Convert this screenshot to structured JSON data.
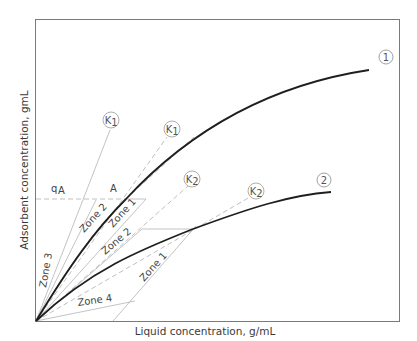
{
  "diagram": {
    "type": "adsorption isotherm zone diagram",
    "x_axis_label": "Liquid concentration, g/mL",
    "y_axis_label": "Adsorbent concentration, gmL",
    "curves": [
      {
        "id": "1",
        "label": "1",
        "style": "thick solid",
        "description": "upper isotherm curve"
      },
      {
        "id": "2",
        "label": "2",
        "style": "thick solid",
        "description": "lower isotherm curve"
      }
    ],
    "line_labels": [
      {
        "label": "K",
        "subscript": "1",
        "style": "thin solid"
      },
      {
        "label": "K",
        "subscript": "1",
        "style": "dashed"
      },
      {
        "label": "K",
        "subscript": "2",
        "style": "dashed"
      },
      {
        "label": "K",
        "subscript": "2",
        "style": "dashed"
      }
    ],
    "point_labels": {
      "q_label": "q",
      "q_subscript": "A",
      "point_A": "A"
    },
    "zones": [
      {
        "label": "Zone 3"
      },
      {
        "label": "Zone 2"
      },
      {
        "label": "Zone 1"
      },
      {
        "label": "Zone 2"
      },
      {
        "label": "Zone 1"
      },
      {
        "label": "Zone 4"
      }
    ],
    "colors": {
      "frame": "#7a7a7a",
      "curve": "#1e1e1e",
      "light_line": "#b4b4b4",
      "dashed_line": "#b8b8b8",
      "text": "#3a3a3a"
    }
  }
}
